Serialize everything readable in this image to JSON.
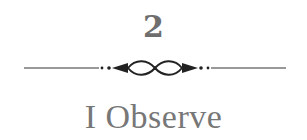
{
  "chapter": {
    "number": "2",
    "title": "I Observe",
    "ornament": "flourish-divider-icon"
  },
  "colors": {
    "text": "#6e6e6e",
    "rule": "#333333"
  }
}
